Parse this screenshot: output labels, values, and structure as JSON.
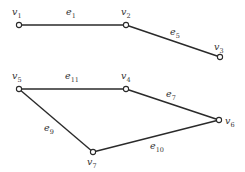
{
  "diagram": {
    "colors": {
      "stroke": "#2a2a2a",
      "text": "#333333",
      "background": "#ffffff"
    },
    "vertices": [
      {
        "id": "v1",
        "base": "v",
        "sub": "1",
        "x": 19,
        "y": 25,
        "lx": 12,
        "ly": 15
      },
      {
        "id": "v2",
        "base": "v",
        "sub": "2",
        "x": 126,
        "y": 25,
        "lx": 121,
        "ly": 15
      },
      {
        "id": "v3",
        "base": "v",
        "sub": "3",
        "x": 220,
        "y": 57,
        "lx": 214,
        "ly": 50
      },
      {
        "id": "v4",
        "base": "v",
        "sub": "4",
        "x": 126,
        "y": 89,
        "lx": 121,
        "ly": 79
      },
      {
        "id": "v5",
        "base": "v",
        "sub": "5",
        "x": 19,
        "y": 89,
        "lx": 12,
        "ly": 79
      },
      {
        "id": "v6",
        "base": "v",
        "sub": "6",
        "x": 219,
        "y": 120,
        "lx": 225,
        "ly": 124
      },
      {
        "id": "v7",
        "base": "v",
        "sub": "7",
        "x": 93,
        "y": 152,
        "lx": 87,
        "ly": 165
      }
    ],
    "edges": [
      {
        "id": "e1",
        "base": "e",
        "sub": "1",
        "from": "v1",
        "to": "v2",
        "lx": 66,
        "ly": 15
      },
      {
        "id": "e5",
        "base": "e",
        "sub": "5",
        "from": "v2",
        "to": "v3",
        "lx": 170,
        "ly": 35
      },
      {
        "id": "e11",
        "base": "e",
        "sub": "11",
        "from": "v5",
        "to": "v4",
        "lx": 65,
        "ly": 79
      },
      {
        "id": "e7",
        "base": "e",
        "sub": "7",
        "from": "v4",
        "to": "v6",
        "lx": 166,
        "ly": 97
      },
      {
        "id": "e9",
        "base": "e",
        "sub": "9",
        "from": "v5",
        "to": "v7",
        "lx": 44,
        "ly": 131
      },
      {
        "id": "e10",
        "base": "e",
        "sub": "10",
        "from": "v7",
        "to": "v6",
        "lx": 150,
        "ly": 149
      }
    ]
  }
}
